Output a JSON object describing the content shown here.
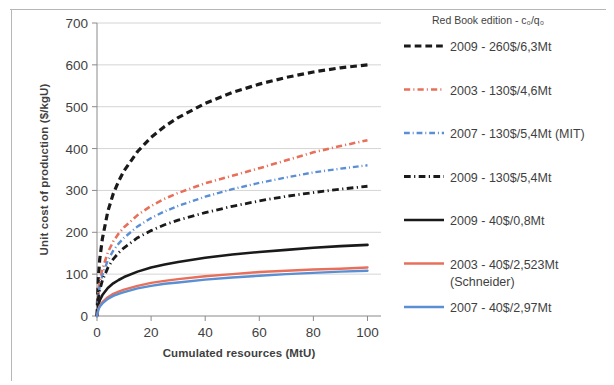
{
  "chart_data": {
    "type": "line",
    "title": "",
    "xlabel": "Cumulated resources (MtU)",
    "ylabel": "Unit cost of production ($/kgU)",
    "xlim": [
      0,
      105
    ],
    "ylim": [
      0,
      700
    ],
    "xticks": [
      0,
      20,
      40,
      60,
      80,
      100
    ],
    "yticks": [
      0,
      100,
      200,
      300,
      400,
      500,
      600,
      700
    ],
    "grid": "horizontal",
    "legend_position": "right",
    "legend_title": "Red Book edition - c₀/q₀",
    "x": [
      0,
      0.5,
      1,
      2,
      4,
      6,
      8,
      10,
      15,
      20,
      25,
      30,
      40,
      50,
      60,
      70,
      80,
      90,
      100
    ],
    "series": [
      {
        "name": "2009 - 260$/6,3Mt",
        "color": "#1a1a1a",
        "style": "dashed",
        "width": 3.2,
        "values": [
          0,
          90,
          135,
          185,
          250,
          292,
          322,
          347,
          393,
          427,
          453,
          474,
          508,
          534,
          554,
          570,
          583,
          593,
          600
        ]
      },
      {
        "name": "2003 - 130$/4,6Mt",
        "color": "#E8705A",
        "style": "dashdot",
        "width": 2.6,
        "values": [
          0,
          57,
          82,
          112,
          152,
          178,
          197,
          212,
          241,
          263,
          280,
          294,
          317,
          335,
          353,
          372,
          391,
          406,
          420
        ]
      },
      {
        "name": "2007 - 130$/5,4Mt (MIT)",
        "color": "#5B8FD4",
        "style": "dashdot",
        "width": 2.4,
        "values": [
          0,
          49,
          71,
          98,
          133,
          156,
          173,
          187,
          214,
          234,
          250,
          263,
          285,
          303,
          318,
          331,
          343,
          352,
          360
        ]
      },
      {
        "name": "2009 - 130$/5,4Mt",
        "color": "#1a1a1a",
        "style": "dashdot",
        "width": 2.8,
        "values": [
          0,
          42,
          61,
          85,
          115,
          136,
          151,
          163,
          187,
          204,
          218,
          229,
          247,
          262,
          275,
          286,
          295,
          303,
          310
        ]
      },
      {
        "name": "2009 - 40$/0,8Mt",
        "color": "#1a1a1a",
        "style": "solid",
        "width": 2.6,
        "values": [
          0,
          26,
          37,
          50,
          67,
          78,
          86,
          93,
          106,
          116,
          123,
          129,
          139,
          147,
          153,
          158,
          163,
          167,
          170
        ]
      },
      {
        "name": "2003 - 40$/2,523Mt",
        "sublabel": "(Schneider)",
        "color": "#E8705A",
        "style": "solid",
        "width": 2.4,
        "values": [
          0,
          17,
          24,
          33,
          45,
          53,
          58,
          63,
          72,
          79,
          84,
          88,
          95,
          100,
          105,
          108,
          111,
          113,
          116
        ]
      },
      {
        "name": "2007 - 40$/2,97Mt",
        "color": "#5B8FD4",
        "style": "solid",
        "width": 2.4,
        "values": [
          0,
          15,
          22,
          30,
          41,
          48,
          53,
          57,
          66,
          72,
          77,
          80,
          87,
          92,
          96,
          100,
          103,
          106,
          108
        ]
      }
    ]
  },
  "legend": {
    "title": "Red Book edition - c₀/q₀",
    "entries": [
      {
        "label": "2009 - 260$/6,3Mt",
        "sublabel": ""
      },
      {
        "label": "2003 - 130$/4,6Mt",
        "sublabel": ""
      },
      {
        "label": "2007 - 130$/5,4Mt (MIT)",
        "sublabel": ""
      },
      {
        "label": "2009 - 130$/5,4Mt",
        "sublabel": ""
      },
      {
        "label": "2009 - 40$/0,8Mt",
        "sublabel": ""
      },
      {
        "label": "2003 - 40$/2,523Mt",
        "sublabel": "(Schneider)"
      },
      {
        "label": "2007 - 40$/2,97Mt",
        "sublabel": ""
      }
    ]
  }
}
